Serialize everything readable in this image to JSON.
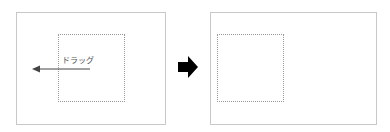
{
  "before": {
    "drag_label": "ドラッグ",
    "direction": "left"
  },
  "transition_arrow": {
    "icon": "right-arrow-icon",
    "color": "#000000"
  },
  "after": {},
  "colors": {
    "frame_border": "#c8c8c8",
    "selection_border": "#9a9a9a",
    "drag_arrow": "#444444"
  }
}
